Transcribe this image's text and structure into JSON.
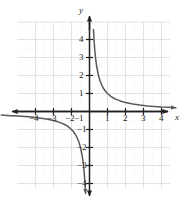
{
  "figure": {
    "name": "reciprocal-function-graph",
    "background_color": "#ffffff",
    "curve_color": "#58595b",
    "axis_color": "#231f20",
    "major_grid_color": "#e4e3e6",
    "minor_grid_color": "#efeef0"
  },
  "axes": {
    "x_axis_label": "x",
    "y_axis_label": "y",
    "x_ticks": [
      {
        "value": -4,
        "label": "−4"
      },
      {
        "value": -3,
        "label": "−3"
      },
      {
        "value": -2,
        "label": "−2"
      },
      {
        "value": -1,
        "label": "−1"
      },
      {
        "value": 1,
        "label": "1"
      },
      {
        "value": 2,
        "label": "2"
      },
      {
        "value": 3,
        "label": "3"
      },
      {
        "value": 4,
        "label": "4"
      }
    ],
    "y_ticks": [
      {
        "value": 4,
        "label": "4"
      },
      {
        "value": 3,
        "label": "3"
      },
      {
        "value": 2,
        "label": "2"
      },
      {
        "value": 1,
        "label": "1"
      },
      {
        "value": -1,
        "label": "−1"
      },
      {
        "value": -2,
        "label": "−2"
      },
      {
        "value": -3,
        "label": "−3"
      },
      {
        "value": -4,
        "label": "−4"
      }
    ]
  },
  "chart_data": {
    "type": "line",
    "title": "",
    "subtitle": "",
    "xlabel": "x",
    "ylabel": "y",
    "xlim": [
      -5.2,
      5.2
    ],
    "ylim": [
      -4.8,
      4.8
    ],
    "grid": true,
    "legend_position": "none",
    "xticks": [
      -4,
      -3,
      -2,
      -1,
      1,
      2,
      3,
      4
    ],
    "yticks": [
      -4,
      -3,
      -2,
      -1,
      1,
      2,
      3,
      4
    ],
    "xtick_labels": [
      "−4",
      "−3",
      "−2",
      "−1",
      "1",
      "2",
      "3",
      "4"
    ],
    "ytick_labels": [
      "−4",
      "−3",
      "−2",
      "−1",
      "1",
      "2",
      "3",
      "4"
    ],
    "annotations": [],
    "series": [
      {
        "name": "y = 1/x (branch x > 0)",
        "x": [
          0.22,
          0.25,
          0.3,
          0.35,
          0.4,
          0.5,
          0.6,
          0.7,
          0.8,
          0.9,
          1.0,
          1.2,
          1.4,
          1.6,
          1.8,
          2.0,
          2.4,
          2.8,
          3.2,
          3.6,
          4.0,
          4.4,
          4.8
        ],
        "y": [
          4.55,
          4.0,
          3.33,
          2.86,
          2.5,
          2.0,
          1.67,
          1.43,
          1.25,
          1.11,
          1.0,
          0.83,
          0.71,
          0.63,
          0.56,
          0.5,
          0.42,
          0.36,
          0.31,
          0.28,
          0.25,
          0.23,
          0.21
        ]
      },
      {
        "name": "y = 1/x (branch x < 0)",
        "x": [
          -4.9,
          -4.4,
          -4.0,
          -3.6,
          -3.2,
          -2.8,
          -2.4,
          -2.0,
          -1.8,
          -1.6,
          -1.4,
          -1.2,
          -1.0,
          -0.9,
          -0.8,
          -0.7,
          -0.6,
          -0.5,
          -0.4,
          -0.35,
          -0.3,
          -0.25,
          -0.22
        ],
        "y": [
          -0.2,
          -0.23,
          -0.25,
          -0.28,
          -0.31,
          -0.36,
          -0.42,
          -0.5,
          -0.56,
          -0.63,
          -0.71,
          -0.83,
          -1.0,
          -1.11,
          -1.25,
          -1.43,
          -1.67,
          -2.0,
          -2.5,
          -2.86,
          -3.33,
          -4.0,
          -4.55
        ]
      }
    ]
  }
}
